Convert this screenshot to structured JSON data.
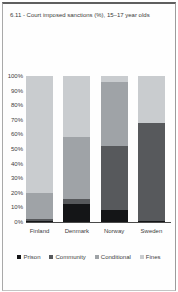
{
  "title": "6.11 - Court imposed sanctions (%), 15–17 year olds",
  "chart_data": {
    "type": "bar",
    "variant": "100%-stacked-column",
    "title": "6.11 - Court imposed sanctions (%), 15–17 year olds",
    "categories": [
      "Finland",
      "Denmark",
      "Norway",
      "Sweden"
    ],
    "series": [
      {
        "name": "Prison",
        "color": "#141517",
        "values": [
          1,
          12,
          8,
          1
        ]
      },
      {
        "name": "Community",
        "color": "#57595c",
        "values": [
          1,
          4,
          44,
          67
        ]
      },
      {
        "name": "Conditional",
        "color": "#9fa3a7",
        "values": [
          18,
          42,
          44,
          0
        ]
      },
      {
        "name": "Fines",
        "color": "#c9cccf",
        "values": [
          80,
          42,
          4,
          32
        ]
      }
    ],
    "xlabel": "",
    "ylabel": "",
    "ylim": [
      0,
      100
    ],
    "yticks": [
      "0%",
      "10%",
      "20%",
      "30%",
      "40%",
      "50%",
      "60%",
      "70%",
      "80%",
      "90%",
      "100%"
    ],
    "grid": false,
    "legend_position": "bottom",
    "axis_text_color": "#404040",
    "baseline_color": "#4a4a4a"
  }
}
